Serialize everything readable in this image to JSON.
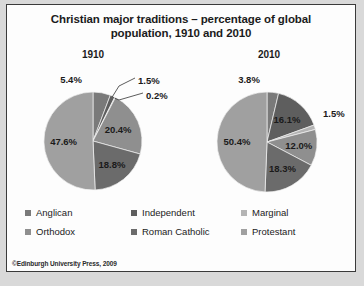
{
  "chart_data": {
    "type": "pie",
    "title": "Christian major traditions – percentage of global population, 1910 and 2010",
    "credit": "©Edinburgh University Press, 2009",
    "legend_position": "bottom",
    "categories": [
      "Anglican",
      "Independent",
      "Marginal",
      "Orthodox",
      "Roman Catholic",
      "Protestant"
    ],
    "colors": [
      "#7a7a7a",
      "#5e5e5e",
      "#b4b4b4",
      "#8f8f8f",
      "#6b6b6b",
      "#a0a0a0"
    ],
    "charts": [
      {
        "name": "1910",
        "labels": [
          "5.4%",
          "1.5%",
          "0.2%",
          "20.4%",
          "18.8%",
          "47.6%"
        ],
        "values": [
          5.4,
          1.5,
          0.2,
          20.4,
          18.8,
          47.6
        ],
        "slices": [
          {
            "category": "Anglican",
            "value": 5.4,
            "label": "5.4%"
          },
          {
            "category": "Independent",
            "value": 1.5,
            "label": "1.5%"
          },
          {
            "category": "Marginal",
            "value": 0.2,
            "label": "0.2%"
          },
          {
            "category": "Orthodox",
            "value": 20.4,
            "label": "20.4%"
          },
          {
            "category": "Roman Catholic",
            "value": 18.8,
            "label": "18.8%"
          },
          {
            "category": "Protestant",
            "value": 47.6,
            "label": "47.6%"
          }
        ]
      },
      {
        "name": "2010",
        "labels": [
          "3.8%",
          "16.1%",
          "1.5%",
          "12.0%",
          "18.3%",
          "50.4%"
        ],
        "values": [
          3.8,
          16.1,
          1.5,
          12.0,
          18.3,
          50.4
        ],
        "slices": [
          {
            "category": "Anglican",
            "value": 3.8,
            "label": "3.8%"
          },
          {
            "category": "Independent",
            "value": 16.1,
            "label": "16.1%"
          },
          {
            "category": "Marginal",
            "value": 1.5,
            "label": "1.5%"
          },
          {
            "category": "Orthodox",
            "value": 12.0,
            "label": "12.0%"
          },
          {
            "category": "Roman Catholic",
            "value": 18.3,
            "label": "18.3%"
          },
          {
            "category": "Protestant",
            "value": 50.4,
            "label": "50.4%"
          }
        ]
      }
    ]
  },
  "years": {
    "left": "1910",
    "right": "2010"
  }
}
